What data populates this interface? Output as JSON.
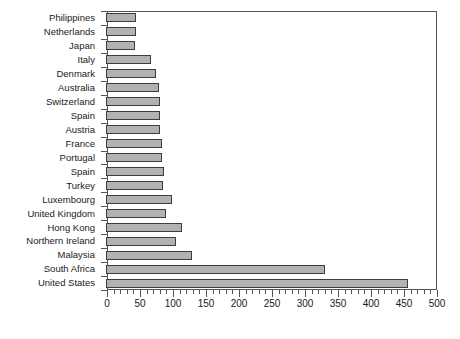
{
  "chart_data": {
    "type": "bar",
    "orientation": "horizontal",
    "title": "",
    "subtitle": "",
    "xlabel": "",
    "ylabel": "",
    "xlim": [
      0,
      500
    ],
    "x_major_step": 50,
    "x_minor_step": 10,
    "grid": false,
    "legend": null,
    "bar_color": "#b2b2b2",
    "bar_edge_color": "#3d3d3d",
    "axis_color": "#555555",
    "background": "#ffffff",
    "xticks": [
      0,
      50,
      100,
      150,
      200,
      250,
      300,
      350,
      400,
      450,
      500
    ],
    "xticklabels": [
      "0",
      "50",
      "100",
      "150",
      "200",
      "250",
      "300",
      "350",
      "400",
      "450",
      "500"
    ],
    "categories": [
      "Philippines",
      "Netherlands",
      "Japan",
      "Italy",
      "Denmark",
      "Australia",
      "Switzerland",
      "Spain",
      "Austria",
      "France",
      "Portugal",
      "Spain",
      "Turkey",
      "Luxembourg",
      "United Kingdom",
      "Hong Kong",
      "Northern Ireland",
      "Malaysia",
      "South Africa",
      "United States"
    ],
    "values": [
      45,
      45,
      44,
      68,
      76,
      80,
      82,
      82,
      82,
      85,
      85,
      88,
      87,
      100,
      91,
      115,
      106,
      130,
      332,
      458
    ]
  }
}
